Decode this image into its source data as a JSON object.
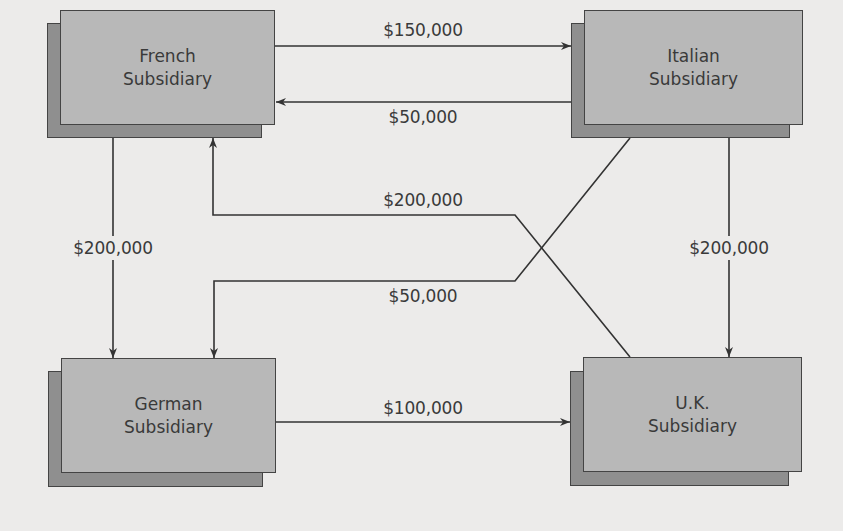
{
  "diagram": {
    "nodes": [
      {
        "id": "french",
        "line1": "French",
        "line2": "Subsidiary"
      },
      {
        "id": "italian",
        "line1": "Italian",
        "line2": "Subsidiary"
      },
      {
        "id": "german",
        "line1": "German",
        "line2": "Subsidiary"
      },
      {
        "id": "uk",
        "line1": "U.K.",
        "line2": "Subsidiary"
      }
    ],
    "flows": [
      {
        "from": "French",
        "to": "Italian",
        "amount": "$150,000"
      },
      {
        "from": "Italian",
        "to": "French",
        "amount": "$50,000"
      },
      {
        "from": "U.K.",
        "to": "French",
        "amount": "$200,000"
      },
      {
        "from": "Italian",
        "to": "German",
        "amount": "$50,000"
      },
      {
        "from": "French",
        "to": "German",
        "amount": "$200,000"
      },
      {
        "from": "Italian",
        "to": "U.K.",
        "amount": "$200,000"
      },
      {
        "from": "German",
        "to": "U.K.",
        "amount": "$100,000"
      }
    ],
    "colors": {
      "background": "#ecebea",
      "box_front": "#b8b8b8",
      "box_shadow": "#8f8f8f",
      "line": "#333333"
    }
  }
}
